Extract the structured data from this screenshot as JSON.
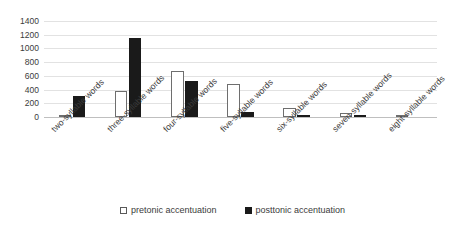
{
  "chart_data": {
    "type": "bar",
    "title": "",
    "xlabel": "",
    "ylabel": "",
    "ylim": [
      0,
      1400
    ],
    "yticks": [
      0,
      200,
      400,
      600,
      800,
      1000,
      1200,
      1400
    ],
    "ytick_labels": [
      "0",
      "200",
      "400",
      "600",
      "800",
      "1000",
      "1200",
      "1400"
    ],
    "grid": true,
    "legend_position": "bottom",
    "categories": [
      "two-syllable words",
      "three-syllable words",
      "four-syllable words",
      "five-syllable words",
      "six-syllable words",
      "seven-syllable words",
      "eight-syllable words"
    ],
    "series": [
      {
        "name": "pretonic accentuation",
        "color": "#ffffff",
        "edge_color": "#6e6e6e",
        "values": [
          20,
          380,
          670,
          480,
          130,
          55,
          20
        ]
      },
      {
        "name": "posttonic accentuation",
        "color": "#1a1a1a",
        "edge_color": "#1a1a1a",
        "values": [
          310,
          1150,
          530,
          70,
          25,
          5,
          0
        ]
      }
    ]
  },
  "legend": {
    "items": [
      {
        "label": "pretonic accentuation",
        "swatch": "open-square-swatch"
      },
      {
        "label": "posttonic accentuation",
        "swatch": "filled-square-swatch"
      }
    ]
  },
  "colors": {
    "background": "#ffffff",
    "gridline": "#e2e2e2",
    "axis": "#bfbfbf",
    "text": "#3b3b3b",
    "series_pretonic": "#ffffff",
    "series_posttonic": "#1a1a1a"
  }
}
